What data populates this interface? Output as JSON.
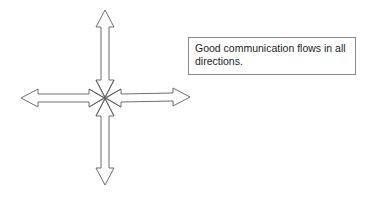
{
  "diagram": {
    "note": "Good communication flows in all directions.",
    "arrows": [
      {
        "name": "up",
        "direction": "up"
      },
      {
        "name": "down",
        "direction": "down"
      },
      {
        "name": "left",
        "direction": "left"
      },
      {
        "name": "right",
        "direction": "right"
      }
    ],
    "colors": {
      "stroke": "#6e6e6e",
      "fill": "#ffffff",
      "background": "#ffffff"
    }
  }
}
